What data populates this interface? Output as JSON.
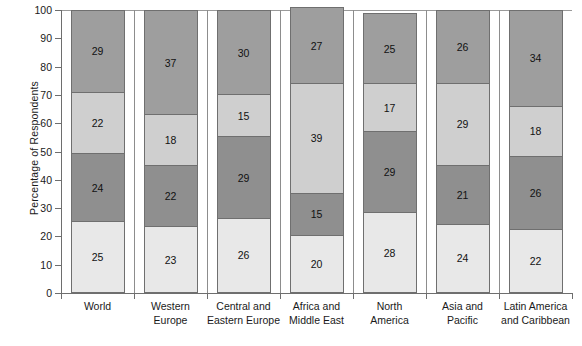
{
  "chart_data": {
    "type": "bar",
    "stacked": true,
    "orientation": "vertical",
    "title": "",
    "xlabel": "",
    "ylabel": "Percentage of Respondents",
    "ylim": [
      0,
      100
    ],
    "yticks": [
      0,
      10,
      20,
      30,
      40,
      50,
      60,
      70,
      80,
      90,
      100
    ],
    "grid": false,
    "legend": "none",
    "categories": [
      "World",
      "Western Europe",
      "Central and Eastern Europe",
      "Africa and Middle East",
      "North America",
      "Asia and Pacific",
      "Latin America and Caribbean"
    ],
    "category_lines": [
      [
        "World"
      ],
      [
        "Western",
        "Europe"
      ],
      [
        "Central and",
        "Eastern Europe"
      ],
      [
        "Africa and",
        "Middle East"
      ],
      [
        "North",
        "America"
      ],
      [
        "Asia and",
        "Pacific"
      ],
      [
        "Latin America",
        "and Caribbean"
      ]
    ],
    "series": [
      {
        "name": "segment-1",
        "color": "#e8e8e8",
        "values": [
          25,
          23,
          26,
          20,
          28,
          24,
          22
        ]
      },
      {
        "name": "segment-2",
        "color": "#8f8f8f",
        "values": [
          24,
          22,
          29,
          15,
          29,
          21,
          26
        ]
      },
      {
        "name": "segment-3",
        "color": "#cfcfcf",
        "values": [
          22,
          18,
          15,
          39,
          17,
          29,
          18
        ]
      },
      {
        "name": "segment-4",
        "color": "#9e9e9e",
        "values": [
          29,
          37,
          30,
          27,
          25,
          26,
          34
        ]
      }
    ],
    "totals": [
      100,
      100,
      100,
      101,
      99,
      100,
      100
    ],
    "colors": {
      "axis": "#6e6e6e",
      "divider": "#8d8d8d",
      "bar_outline": "#6f6f6f",
      "text": "#1a1a1a",
      "background": "#ffffff"
    }
  }
}
